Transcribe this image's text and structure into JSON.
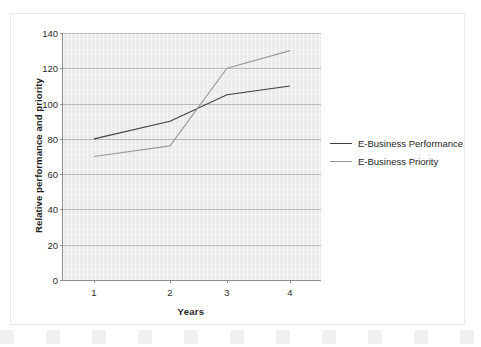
{
  "figure": {
    "caption_fragment": "",
    "background_color": "#ffffff",
    "frame_color": "#e9e9ec"
  },
  "chart_data": {
    "type": "line",
    "title": "",
    "xlabel": "Years",
    "ylabel": "Relative performance and priority",
    "categories": [
      "1",
      "2",
      "3",
      "4"
    ],
    "x": [
      1,
      2,
      3,
      4
    ],
    "series": [
      {
        "name": "E-Business Performance",
        "values": [
          80,
          90,
          105,
          110
        ],
        "color": "#3f3f3f"
      },
      {
        "name": "E-Business Priority",
        "values": [
          70,
          76,
          120,
          130
        ],
        "color": "#9a9a9a"
      }
    ],
    "ylim": [
      0,
      140
    ],
    "yticks": [
      0,
      20,
      40,
      60,
      80,
      100,
      120,
      140
    ],
    "ytick_labels": [
      "0",
      "20",
      "40",
      "60",
      "80",
      "100",
      "120",
      "140"
    ],
    "xtick_labels": [
      "1",
      "2",
      "3",
      "4"
    ],
    "grid": "horizontal",
    "plot_background": "#ebebeb",
    "gridline_color": "#b9b9b9",
    "axis_color": "#8d8d8d",
    "legend_position": "right",
    "legend_entries": [
      "E-Business Performance",
      "E-Business Priority"
    ]
  }
}
